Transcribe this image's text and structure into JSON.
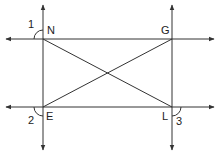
{
  "diagram": {
    "type": "geometry",
    "points": [
      {
        "label": "N",
        "x": 43,
        "y": 39
      },
      {
        "label": "G",
        "x": 172,
        "y": 39
      },
      {
        "label": "E",
        "x": 43,
        "y": 107
      },
      {
        "label": "L",
        "x": 172,
        "y": 107
      }
    ],
    "angles": [
      {
        "label": "1",
        "at": "N"
      },
      {
        "label": "2",
        "at": "E"
      },
      {
        "label": "3",
        "at": "L"
      }
    ],
    "segments": [
      "NL",
      "EG"
    ],
    "lines": [
      "NG (horizontal)",
      "EL (horizontal)",
      "NE (vertical)",
      "GL (vertical)"
    ],
    "colors": {
      "stroke": "#333333",
      "background": "#ffffff"
    }
  }
}
